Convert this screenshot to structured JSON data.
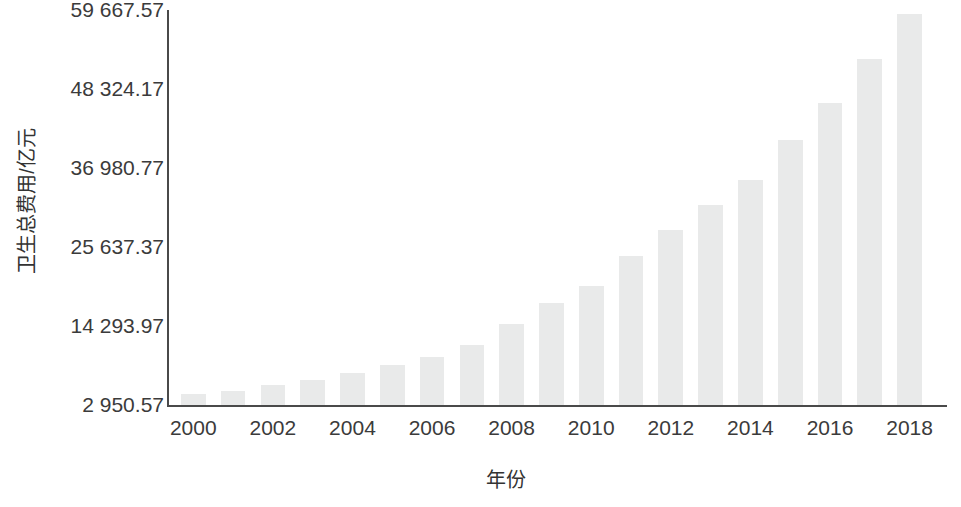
{
  "chart_data": {
    "type": "bar",
    "title": "",
    "xlabel": "年份",
    "ylabel": "卫生总费用/亿元",
    "grid": false,
    "legend": "none",
    "bar_color": "#e9eaea",
    "axis_color": "#4a4a4a",
    "text_color": "#3b3b3b",
    "ylim": [
      2950.57,
      59667.57
    ],
    "ytick_labels": [
      "59 667.57",
      "48 324.17",
      "36 980.77",
      "25 637.37",
      "14 293.97",
      "2 950.57"
    ],
    "ytick_values": [
      59667.57,
      48324.17,
      36980.77,
      25637.37,
      14293.97,
      2950.57
    ],
    "xtick_labels": [
      "2000",
      "2002",
      "2004",
      "2006",
      "2008",
      "2010",
      "2012",
      "2014",
      "2016",
      "2018"
    ],
    "categories": [
      "2000",
      "2001",
      "2002",
      "2003",
      "2004",
      "2005",
      "2006",
      "2007",
      "2008",
      "2009",
      "2010",
      "2011",
      "2012",
      "2013",
      "2014",
      "2015",
      "2016",
      "2017",
      "2018"
    ],
    "values": [
      4586.63,
      5025.93,
      5790.03,
      6584.1,
      7590.29,
      8659.91,
      9843.34,
      11573.97,
      14535.4,
      17541.92,
      19980.39,
      24345.91,
      28119.0,
      31668.95,
      35312.4,
      40974.64,
      46344.88,
      52598.28,
      59121.9
    ]
  },
  "axes": {
    "y_title": "卫生总费用/亿元",
    "x_title": "年份"
  }
}
